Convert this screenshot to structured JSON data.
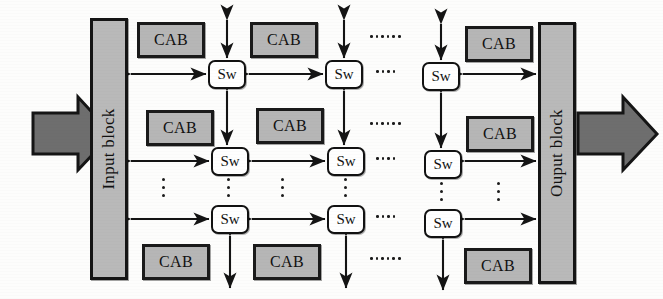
{
  "figure": {
    "type": "architecture-block-diagram",
    "width": 663,
    "height": 299,
    "background_color": "#fdfdfc"
  },
  "colors": {
    "cab_fill": "#b6b6b6",
    "cab_border": "#1a1a1a",
    "switch_fill": "#ffffff",
    "switch_border": "#121212",
    "io_block_fill": "#b9b9b9",
    "io_block_border": "#151515",
    "arrow_stroke": "#141414",
    "flow_arrow_fill": "#6e6e6e",
    "flow_arrow_border": "#151515",
    "dot_color": "#1c1c1c"
  },
  "io_blocks": {
    "input": {
      "label": "Input block",
      "orientation": "vertical-ccw"
    },
    "output": {
      "label": "Ouput block",
      "orientation": "vertical-ccw"
    }
  },
  "flow_arrows": [
    {
      "name": "input-flow-arrow",
      "direction": "right",
      "position": "left-of-input-block"
    },
    {
      "name": "output-flow-arrow",
      "direction": "right",
      "position": "right-of-output-block"
    }
  ],
  "labels": {
    "cab": "CAB",
    "switch": "Sw"
  },
  "cabs": [
    {
      "id": "cab-r0-c0",
      "label": "CAB",
      "x": 137,
      "y": 22,
      "w": 68,
      "h": 36
    },
    {
      "id": "cab-r0-c1",
      "label": "CAB",
      "x": 250,
      "y": 22,
      "w": 68,
      "h": 36
    },
    {
      "id": "cab-r0-c3",
      "label": "CAB",
      "x": 465,
      "y": 26,
      "w": 68,
      "h": 36
    },
    {
      "id": "cab-r1-c0",
      "label": "CAB",
      "x": 146,
      "y": 110,
      "w": 68,
      "h": 36
    },
    {
      "id": "cab-r1-c1",
      "label": "CAB",
      "x": 256,
      "y": 108,
      "w": 68,
      "h": 36
    },
    {
      "id": "cab-r1-c3",
      "label": "CAB",
      "x": 466,
      "y": 116,
      "w": 68,
      "h": 36
    },
    {
      "id": "cab-r3-c0",
      "label": "CAB",
      "x": 142,
      "y": 244,
      "w": 68,
      "h": 36
    },
    {
      "id": "cab-r3-c1",
      "label": "CAB",
      "x": 253,
      "y": 244,
      "w": 68,
      "h": 36
    },
    {
      "id": "cab-r3-c3",
      "label": "CAB",
      "x": 464,
      "y": 248,
      "w": 68,
      "h": 36
    }
  ],
  "switches": [
    {
      "id": "sw-r0-c0",
      "label": "Sw",
      "x": 208,
      "y": 60,
      "w": 38,
      "h": 29
    },
    {
      "id": "sw-r0-c1",
      "label": "Sw",
      "x": 325,
      "y": 60,
      "w": 38,
      "h": 29
    },
    {
      "id": "sw-r0-c2",
      "label": "Sw",
      "x": 422,
      "y": 62,
      "w": 38,
      "h": 29
    },
    {
      "id": "sw-r1-c0",
      "label": "Sw",
      "x": 211,
      "y": 147,
      "w": 38,
      "h": 29
    },
    {
      "id": "sw-r1-c1",
      "label": "Sw",
      "x": 327,
      "y": 147,
      "w": 38,
      "h": 29
    },
    {
      "id": "sw-r1-c2",
      "label": "Sw",
      "x": 424,
      "y": 150,
      "w": 38,
      "h": 29
    },
    {
      "id": "sw-r2-c0",
      "label": "Sw",
      "x": 211,
      "y": 205,
      "w": 38,
      "h": 29
    },
    {
      "id": "sw-r2-c1",
      "label": "Sw",
      "x": 327,
      "y": 205,
      "w": 38,
      "h": 29
    },
    {
      "id": "sw-r2-c2",
      "label": "Sw",
      "x": 424,
      "y": 209,
      "w": 38,
      "h": 29
    }
  ],
  "horizontal_ellipses": [
    {
      "id": "hdots-row-cab-top",
      "dots": 6,
      "x": 370,
      "y": 39
    },
    {
      "id": "hdots-row-sw-top",
      "dots": 4,
      "x": 376,
      "y": 74
    },
    {
      "id": "hdots-row-cab-mid",
      "dots": 6,
      "x": 370,
      "y": 126
    },
    {
      "id": "hdots-row-sw-mid",
      "dots": 4,
      "x": 376,
      "y": 161
    },
    {
      "id": "hdots-row-sw-bottom",
      "dots": 4,
      "x": 376,
      "y": 219
    },
    {
      "id": "hdots-row-cab-bottom",
      "dots": 6,
      "x": 370,
      "y": 261
    }
  ],
  "vertical_ellipses": [
    {
      "id": "vdots-col-a",
      "dots": 3,
      "x": 162,
      "y": 178
    },
    {
      "id": "vdots-col-b",
      "dots": 3,
      "x": 227,
      "y": 178
    },
    {
      "id": "vdots-col-c",
      "dots": 3,
      "x": 281,
      "y": 178
    },
    {
      "id": "vdots-col-d",
      "dots": 3,
      "x": 343,
      "y": 178
    },
    {
      "id": "vdots-col-e",
      "dots": 3,
      "x": 440,
      "y": 182
    },
    {
      "id": "vdots-col-f",
      "dots": 3,
      "x": 497,
      "y": 182
    }
  ]
}
